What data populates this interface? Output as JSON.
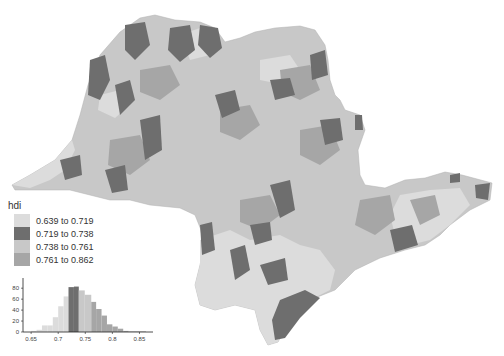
{
  "map": {
    "region": "São Paulo state municipalities",
    "variable": "hdi",
    "colors": {
      "class1": "#dcdcdc",
      "class2": "#6e6e6e",
      "class3": "#c8c8c8",
      "class4": "#a6a6a6"
    }
  },
  "legend": {
    "title": "hdi",
    "items": [
      {
        "label": "0.639 to 0.719",
        "color": "#dcdcdc"
      },
      {
        "label": "0.719 to 0.738",
        "color": "#6e6e6e"
      },
      {
        "label": "0.738 to 0.761",
        "color": "#c8c8c8"
      },
      {
        "label": "0.761 to 0.862",
        "color": "#a6a6a6"
      }
    ]
  },
  "chart_data": {
    "type": "bar",
    "title": "",
    "xlabel": "",
    "ylabel": "",
    "x_ticks": [
      "0.65",
      "0.7",
      "0.75",
      "0.8",
      "0.85"
    ],
    "y_ticks": [
      "0",
      "20",
      "40",
      "60",
      "80"
    ],
    "ylim": [
      0,
      95
    ],
    "xlim": [
      0.635,
      0.875
    ],
    "bins": [
      {
        "x0": 0.65,
        "x1": 0.66,
        "count": 2,
        "class": 1
      },
      {
        "x0": 0.66,
        "x1": 0.67,
        "count": 4,
        "class": 1
      },
      {
        "x0": 0.67,
        "x1": 0.68,
        "count": 12,
        "class": 1
      },
      {
        "x0": 0.68,
        "x1": 0.69,
        "count": 12,
        "class": 1
      },
      {
        "x0": 0.69,
        "x1": 0.7,
        "count": 27,
        "class": 1
      },
      {
        "x0": 0.7,
        "x1": 0.71,
        "count": 47,
        "class": 1
      },
      {
        "x0": 0.71,
        "x1": 0.719,
        "count": 65,
        "class": 1
      },
      {
        "x0": 0.719,
        "x1": 0.729,
        "count": 82,
        "class": 2
      },
      {
        "x0": 0.729,
        "x1": 0.738,
        "count": 83,
        "class": 2
      },
      {
        "x0": 0.738,
        "x1": 0.749,
        "count": 76,
        "class": 3
      },
      {
        "x0": 0.749,
        "x1": 0.761,
        "count": 68,
        "class": 3
      },
      {
        "x0": 0.761,
        "x1": 0.77,
        "count": 55,
        "class": 4
      },
      {
        "x0": 0.77,
        "x1": 0.78,
        "count": 42,
        "class": 4
      },
      {
        "x0": 0.78,
        "x1": 0.79,
        "count": 30,
        "class": 4
      },
      {
        "x0": 0.79,
        "x1": 0.8,
        "count": 14,
        "class": 4
      },
      {
        "x0": 0.8,
        "x1": 0.81,
        "count": 10,
        "class": 4
      },
      {
        "x0": 0.81,
        "x1": 0.82,
        "count": 6,
        "class": 4
      },
      {
        "x0": 0.82,
        "x1": 0.83,
        "count": 2,
        "class": 4
      },
      {
        "x0": 0.83,
        "x1": 0.862,
        "count": 1,
        "class": 4
      }
    ]
  }
}
